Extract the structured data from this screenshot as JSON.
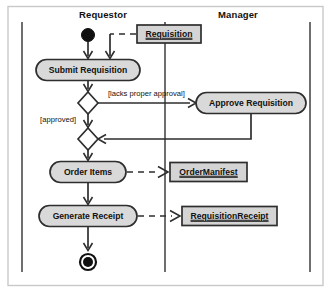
{
  "diagram": {
    "type": "uml-activity-diagram",
    "background_color": "#ffffff",
    "frame_border_color": "#c9c9c9",
    "node_fill_color": "#d9d9d9",
    "line_color": "#2e2e2e"
  },
  "swimlanes": [
    {
      "id": "requestor",
      "label": "Requestor",
      "label_x": 103,
      "label_y": 18
    },
    {
      "id": "manager",
      "label": "Manager",
      "label_y": 18,
      "label_x": 238
    }
  ],
  "lane_dividers": [
    {
      "x": 22,
      "y1": 22,
      "y2": 272
    },
    {
      "x": 165,
      "y1": 22,
      "y2": 272
    },
    {
      "x": 310,
      "y1": 22,
      "y2": 272
    }
  ],
  "nodes": {
    "initial": {
      "name": "initial-node",
      "cx": 88,
      "cy": 35,
      "r": 6.5
    },
    "requisition_object": {
      "name": "Requisition",
      "x": 137,
      "y": 25,
      "w": 64,
      "h": 18
    },
    "submit_requisition": {
      "name": "Submit Requisition",
      "cx": 88,
      "cy": 70,
      "w": 104,
      "h": 21
    },
    "decision": {
      "name": "decision-node",
      "cx": 88,
      "cy": 103,
      "rx": 10,
      "ry": 11
    },
    "approve_requisition": {
      "name": "Approve Requisition",
      "cx": 251,
      "cy": 103,
      "w": 110,
      "h": 21
    },
    "merge": {
      "name": "merge-node",
      "cx": 88,
      "cy": 139,
      "rx": 10,
      "ry": 11
    },
    "order_items": {
      "name": "Order Items",
      "cx": 88,
      "cy": 172,
      "w": 76,
      "h": 21
    },
    "order_manifest_object": {
      "name": "OrderManifest",
      "x": 170,
      "y": 162,
      "w": 77,
      "h": 19
    },
    "generate_receipt": {
      "name": "Generate Receipt",
      "cx": 88,
      "cy": 216,
      "w": 98,
      "h": 21
    },
    "requisition_receipt_object": {
      "name": "RequisitionReceipt",
      "x": 182,
      "y": 207,
      "w": 95,
      "h": 19
    },
    "final": {
      "name": "final-node",
      "cx": 88,
      "cy": 262,
      "r_outer": 8,
      "r_inner": 5
    }
  },
  "guards": {
    "lacks_proper_approval": {
      "text": "[lacks proper approval]",
      "x": 108,
      "y": 96
    },
    "approved": {
      "text": "[approved]",
      "x": 76,
      "y": 122
    }
  }
}
